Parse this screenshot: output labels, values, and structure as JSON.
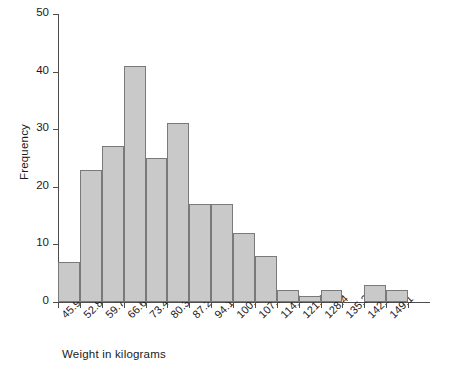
{
  "chart_data": {
    "type": "bar",
    "title": "",
    "xlabel": "Weight in kilograms",
    "ylabel": "Frequency",
    "grid": false,
    "legend": false,
    "ylim": [
      0,
      50
    ],
    "ytick_labels": [
      "0",
      "10",
      "20",
      "30",
      "40",
      "50"
    ],
    "ytick_values": [
      0,
      10,
      20,
      30,
      40,
      50
    ],
    "categories": [
      "45.9",
      "52.8",
      "59.7",
      "66.6",
      "73.4",
      "80.3",
      "87.2",
      "94.1",
      "100.9",
      "107.8",
      "114.7",
      "121.6",
      "128.4",
      "135.3",
      "142.2",
      "149.1"
    ],
    "bin_edges": [
      45.9,
      52.8,
      59.7,
      66.6,
      73.4,
      80.3,
      87.2,
      94.1,
      100.9,
      107.8,
      114.7,
      121.6,
      128.4,
      135.3,
      142.2,
      149.1,
      156.0
    ],
    "values": [
      7,
      23,
      27,
      41,
      25,
      31,
      17,
      17,
      12,
      8,
      2,
      1,
      2,
      0,
      3,
      2
    ],
    "bar_fill": "#c9c9c9",
    "bar_border": "#7a7a7a",
    "axis_color": "#4d4d4d"
  }
}
